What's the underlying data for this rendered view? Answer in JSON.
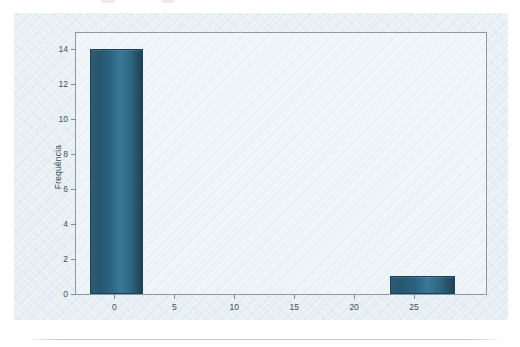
{
  "figure": {
    "background_color": "#dde9f0",
    "plot_background_color": "#e9f1f6",
    "frame_color": "#8d9aa6",
    "bar_color": "#2c6280",
    "bar_edge_color": "#1c4055"
  },
  "chart_data": {
    "type": "bar",
    "title": "",
    "subtitle": "",
    "xlabel": "",
    "ylabel": "Frequência",
    "xlim": [
      -3.2,
      31.0
    ],
    "ylim": [
      0,
      14.9
    ],
    "grid": false,
    "legend": null,
    "x_ticks": [
      0,
      5,
      10,
      15,
      20,
      25
    ],
    "x_tick_labels": [
      "0",
      "5",
      "10",
      "15",
      "20",
      "25"
    ],
    "y_ticks": [
      0,
      2,
      4,
      6,
      8,
      10,
      12,
      14
    ],
    "y_tick_labels": [
      "0",
      "2",
      "4",
      "6",
      "8",
      "10",
      "12",
      "14"
    ],
    "bars": [
      {
        "label": "0",
        "x_start": -2.0,
        "x_end": 2.4,
        "center": 0.2,
        "value": 14
      },
      {
        "label": "25",
        "x_start": 23.0,
        "x_end": 28.4,
        "center": 25.7,
        "value": 1
      }
    ],
    "categories": [
      "0",
      "25"
    ],
    "values": [
      14,
      1
    ],
    "annotations": []
  },
  "top_remnant": {
    "smudges": [
      {
        "left": 101,
        "width": 14
      },
      {
        "left": 162,
        "width": 12
      }
    ]
  }
}
